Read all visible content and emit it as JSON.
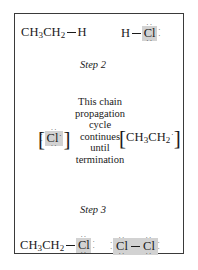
{
  "figure": {
    "type": "chain-propagation-cycle-diagram",
    "border_color": "#3a3a3a",
    "highlight_color": "#d2d2d2",
    "line_color": "#1a1a1a"
  },
  "reactants_top": {
    "left": {
      "formula_prefix": "CH",
      "sub1": "3",
      "formula_mid": "CH",
      "sub2": "2",
      "bond": "—",
      "atom": "H",
      "full_text": "CH3CH2—H"
    },
    "right": {
      "atom_left": "H",
      "bond": "—",
      "atom_right": "Cl",
      "highlighted": "Cl",
      "lone_pairs": [
        "top",
        "bottom",
        "right"
      ],
      "full_text": "H—Cl:"
    }
  },
  "intermediates": {
    "left": {
      "bracket_open": "[",
      "atom": "Cl",
      "radical_dot": "·",
      "bracket_close": "]",
      "highlighted": "Cl",
      "lone_pairs": [
        "top",
        "bottom",
        "left"
      ],
      "full_text": "[·Cl:]"
    },
    "right": {
      "bracket_open": "[",
      "formula_prefix": "CH",
      "sub1": "3",
      "formula_mid": "CH",
      "sub2": "2",
      "radical_dot": "·",
      "bracket_close": "]",
      "full_text": "[CH3CH2·]"
    }
  },
  "products_bottom": {
    "left": {
      "formula_prefix": "CH",
      "sub1": "3",
      "formula_mid": "CH",
      "sub2": "2",
      "bond": "—",
      "atom": "Cl",
      "highlighted": "Cl",
      "lone_pairs": [
        "top",
        "bottom",
        "right"
      ],
      "full_text": "CH3CH2—Cl:"
    },
    "right": {
      "atom_left": "Cl",
      "bond": "—",
      "atom_right": "Cl",
      "highlighted": "Cl—Cl",
      "lone_pairs_left": [
        "top",
        "bottom",
        "left"
      ],
      "lone_pairs_right": [
        "top",
        "bottom",
        "right"
      ],
      "full_text": ":Cl—Cl:"
    }
  },
  "cycle": {
    "lines": [
      "This chain",
      "propagation",
      "cycle",
      "continues",
      "until",
      "termination"
    ]
  },
  "steps": {
    "step2_label": "Step 2",
    "step3_label": "Step 3"
  },
  "dots": {
    "pair_horizontal": "··",
    "single": "·"
  }
}
